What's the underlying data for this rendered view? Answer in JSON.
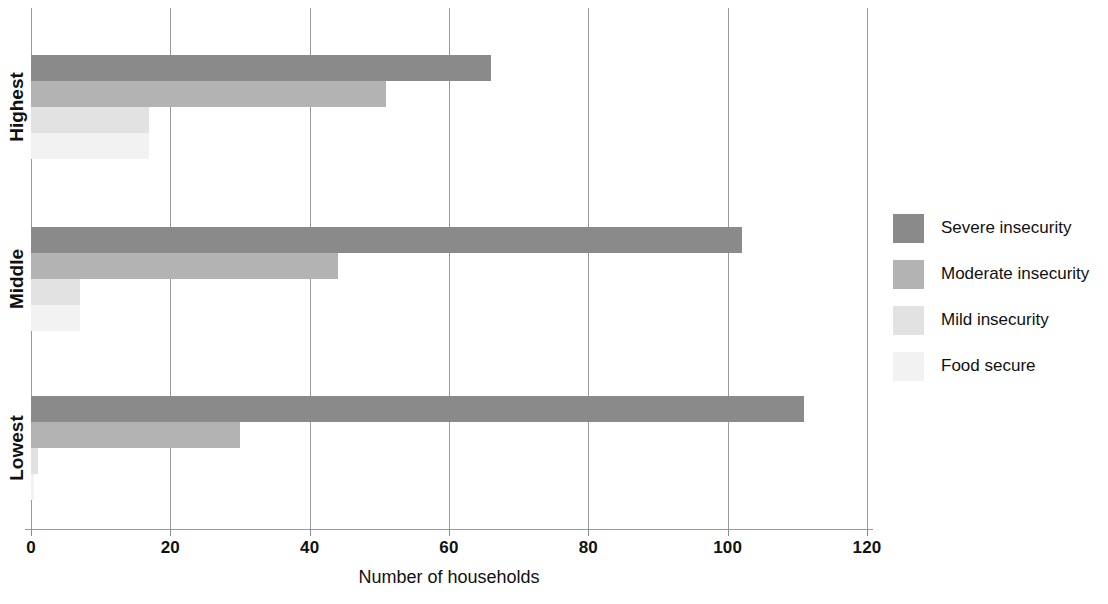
{
  "chart_data": {
    "type": "bar",
    "orientation": "horizontal",
    "title": "",
    "xlabel": "Number of households",
    "ylabel": "",
    "xlim": [
      0,
      120
    ],
    "xticks": [
      0,
      20,
      40,
      60,
      80,
      100,
      120
    ],
    "xtick_labels": [
      "0",
      "20",
      "40",
      "60",
      "80",
      "100",
      "120"
    ],
    "grid": true,
    "grid_axis": "x",
    "legend_position": "right",
    "categories": [
      "Lowest",
      "Middle",
      "Highest"
    ],
    "series": [
      {
        "name": "Severe insecurity",
        "color": "#8a8a8a",
        "values": [
          111,
          102,
          66
        ]
      },
      {
        "name": "Moderate insecurity",
        "color": "#b3b3b3",
        "values": [
          30,
          44,
          51
        ]
      },
      {
        "name": "Mild insecurity",
        "color": "#e2e2e2",
        "values": [
          1,
          7,
          17
        ]
      },
      {
        "name": "Food secure",
        "color": "#f2f2f2",
        "values": [
          0.5,
          7,
          17
        ]
      }
    ]
  },
  "axis": {
    "x_title": "Number of households",
    "tick_labels": [
      "0",
      "20",
      "40",
      "60",
      "80",
      "100",
      "120"
    ],
    "category_labels": [
      "Highest",
      "Middle",
      "Lowest"
    ]
  },
  "legend": {
    "entries": [
      {
        "label": "Severe insecurity",
        "color": "#8a8a8a"
      },
      {
        "label": "Moderate insecurity",
        "color": "#b3b3b3"
      },
      {
        "label": "Mild insecurity",
        "color": "#e2e2e2"
      },
      {
        "label": "Food secure",
        "color": "#f2f2f2"
      }
    ]
  }
}
